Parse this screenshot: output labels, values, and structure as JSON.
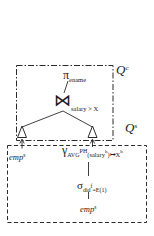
{
  "colors": {
    "ink": "#1a1a1a",
    "background": "#ffffff"
  },
  "diagram": {
    "client": {
      "label": {
        "base": "Q",
        "sup": "c"
      },
      "projection": {
        "op": "π",
        "attr": "ename"
      },
      "join": {
        "op": "⋈",
        "cond": "salary > X"
      }
    },
    "server": {
      "label": {
        "base": "Q",
        "sup": "s"
      },
      "left_relation": {
        "name": "emp",
        "sup": "s"
      },
      "aggregation": {
        "op": "γ",
        "fn": "AVG",
        "scheme": "PH",
        "arg_open": "(salary",
        "arg_sup": "h",
        "arg_close": ")",
        "mapsto": "↦",
        "result": "X",
        "result_sup": "h"
      },
      "selection": {
        "op": "σ",
        "attr": "did",
        "attr_sup": "f",
        "pred": "=E(1)"
      },
      "base_relation": {
        "name": "emp",
        "sup": "s"
      }
    }
  }
}
